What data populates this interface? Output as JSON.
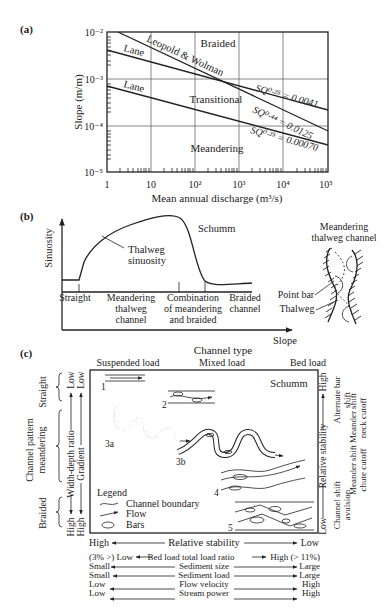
{
  "panel_a": {
    "label": "(a)",
    "ylabel": "Slope (m/m)",
    "xlabel": "Mean annual discharge (m³/s)",
    "y_ticks": [
      "10⁻²",
      "10⁻³",
      "10⁻⁴",
      "10⁻⁵"
    ],
    "x_ticks": [
      "1",
      "10",
      "10²",
      "10³",
      "10⁴",
      "10⁵"
    ],
    "regions": {
      "braided": "Braided",
      "transitional": "Transitional",
      "meandering": "Meandering"
    },
    "line_labels": {
      "leopold": "Leopold & Wolman",
      "lane_upper": "Lane",
      "lane_lower": "Lane",
      "eq1": "SQ⁰·²⁵ = 0.0041",
      "eq2": "SQ⁰·⁴⁴ = 0.0125",
      "eq3": "SQ⁰·²⁵ = 0.00070"
    }
  },
  "panel_b": {
    "label": "(b)",
    "ylabel": "Sinuosity",
    "xlabel": "Slope",
    "curve_label": "Schumm",
    "annotation_line1": "Thalweg",
    "annotation_line2": "sinuosity",
    "categories": [
      {
        "l1": "Straight",
        "l2": "",
        "l3": ""
      },
      {
        "l1": "Meandering",
        "l2": "thalweg",
        "l3": "channel"
      },
      {
        "l1": "Combination",
        "l2": "of meandering",
        "l3": "and braided"
      },
      {
        "l1": "Braided",
        "l2": "channel",
        "l3": ""
      }
    ],
    "inset_title_1": "Meandering",
    "inset_title_2": "thalweg channel",
    "inset_point_bar": "Point bar",
    "inset_thalweg": "Thalweg"
  },
  "panel_c": {
    "label": "(c)",
    "title": "Channel type",
    "columns": [
      "Suspended load",
      "Mixed load",
      "Bed load"
    ],
    "source": "Schumm",
    "pattern_numbers": [
      "1",
      "2",
      "3a",
      "3b",
      "4",
      "5"
    ],
    "left_group_title_1": "Channel pattern",
    "left_group_title_2": "meandering",
    "left_groups": {
      "straight": "Straight",
      "braided": "Braided"
    },
    "left_axis_1": {
      "top": "Low",
      "label": "Width-depth ratio",
      "bottom": "High"
    },
    "left_axis_2": {
      "top": "Low",
      "label": "Gradient",
      "bottom": "High"
    },
    "right_axis": {
      "top": "High",
      "label": "Relative stability",
      "bottom": "Low"
    },
    "right_labels": [
      {
        "l1": "Alternate bar",
        "l2": "shift"
      },
      {
        "l1": "Meander shift",
        "l2": "neck cutoff"
      },
      {
        "l1": "Meander shift",
        "l2": "chute cutoff"
      },
      {
        "l1": "Channel shift",
        "l2": "avulsion"
      }
    ],
    "legend": {
      "title": "Legend",
      "items": [
        "Channel boundary",
        "Flow",
        "Bars"
      ]
    },
    "bottom_scales": [
      {
        "left": "High",
        "label": "Relative stability",
        "right": "Low"
      },
      {
        "left": "(3% >) Low",
        "label": "Bed load   total load ratio",
        "right": "High (> 11%)"
      },
      {
        "left": "Small",
        "label": "Sediment size",
        "right": "Large"
      },
      {
        "left": "Small",
        "label": "Sediment load",
        "right": "Large"
      },
      {
        "left": "Low",
        "label": "Flow velocity",
        "right": "High"
      },
      {
        "left": "Low",
        "label": "Stream power",
        "right": "High"
      }
    ]
  }
}
